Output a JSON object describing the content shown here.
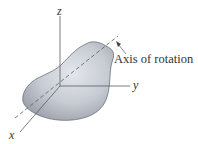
{
  "figure": {
    "axes": {
      "z": "z",
      "y": "y",
      "x": "x"
    },
    "annotation": "Axis of rotation",
    "colors": {
      "body_fill": "#c9cdd5",
      "body_stroke": "#6c7079",
      "axis": "#555a63"
    }
  }
}
